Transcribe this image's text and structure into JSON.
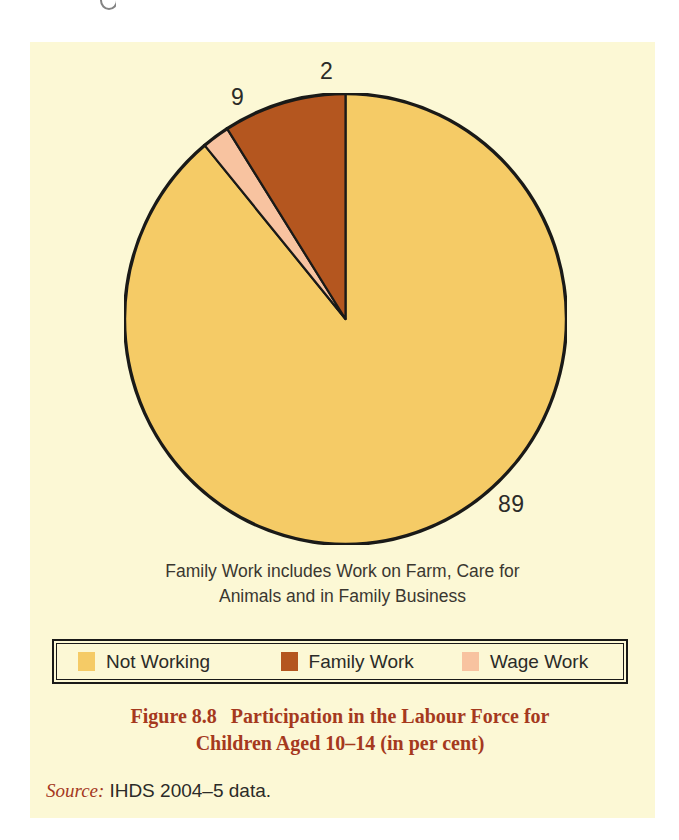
{
  "figure": {
    "background_color": "#fcf8d5",
    "page_color": "#ffffff"
  },
  "chart_data": {
    "type": "pie",
    "title": "Participation in the Labour Force for Children Aged 10–14 (in per cent)",
    "categories": [
      "Not Working",
      "Family Work",
      "Wage Work"
    ],
    "values": [
      89,
      9,
      2
    ],
    "unit": "per cent",
    "colors": [
      "#f5cb66",
      "#b4561f",
      "#f8c3a0"
    ],
    "start_angle_deg": 0,
    "direction": "clockwise",
    "stroke_color": "#1a1a18",
    "labels": [
      {
        "name": "not-working",
        "text": "89",
        "value": 89
      },
      {
        "name": "family-work",
        "text": "9",
        "value": 9
      },
      {
        "name": "wage-work",
        "text": "2",
        "value": 2
      }
    ],
    "legend_position": "bottom",
    "note": "Family Work includes Work on Farm, Care for Animals and in Family Business"
  },
  "note": {
    "line1": "Family Work includes Work on Farm, Care for",
    "line2": "Animals and in Family Business"
  },
  "legend": {
    "items": [
      {
        "label": "Not Working",
        "color": "#f5cb66"
      },
      {
        "label": "Family Work",
        "color": "#b4561f"
      },
      {
        "label": "Wage Work",
        "color": "#f8c3a0"
      }
    ]
  },
  "caption": {
    "figure_number": "Figure 8.8",
    "line1": "Participation in the Labour Force for",
    "line2": "Children Aged 10–14 (in per cent)",
    "color": "#a5391e"
  },
  "source": {
    "label": "Source:",
    "text": "IHDS 2004–5 data."
  }
}
